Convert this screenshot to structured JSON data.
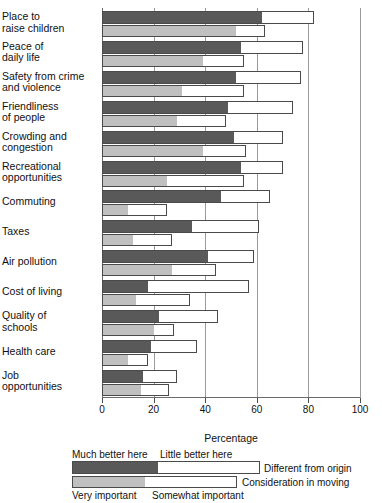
{
  "chart_data": {
    "type": "bar",
    "title": "",
    "subtitle": "",
    "xlabel": "Percentage",
    "ylabel": "",
    "xlim": [
      0,
      100
    ],
    "xticks": [
      0,
      20,
      40,
      60,
      80,
      100
    ],
    "grid": true,
    "orientation": "horizontal",
    "legend_position": "bottom",
    "colors": {
      "much_better_here": "#595959",
      "little_better_here": "#ffffff",
      "very_important": "#c0c0c0",
      "somewhat_important": "#ffffff",
      "bar_outline": "#4a4a4a",
      "gridline": "#9a9a9a"
    },
    "categories": [
      "Place to raise children",
      "Peace of daily life",
      "Safety from crime and violence",
      "Friendliness of people",
      "Crowding and congestion",
      "Recreational opportunities",
      "Commuting",
      "Taxes",
      "Air pollution",
      "Cost of living",
      "Quality of schools",
      "Health care",
      "Job opportunities"
    ],
    "series": [
      {
        "name": "Much better here",
        "group": "Different from origin",
        "values": [
          62,
          54,
          52,
          49,
          51,
          54,
          46,
          35,
          41,
          18,
          22,
          19,
          16
        ]
      },
      {
        "name": "Little better here",
        "group": "Different from origin",
        "values": [
          20,
          24,
          25,
          25,
          19,
          16,
          19,
          26,
          18,
          39,
          23,
          18,
          13
        ]
      },
      {
        "name": "Very important",
        "group": "Consideration in moving",
        "values": [
          52,
          39,
          31,
          29,
          39,
          25,
          10,
          12,
          27,
          13,
          20,
          10,
          15
        ]
      },
      {
        "name": "Somewhat important",
        "group": "Consideration in moving",
        "values": [
          11,
          16,
          24,
          19,
          17,
          30,
          15,
          15,
          17,
          21,
          8,
          8,
          11
        ]
      }
    ],
    "totals": {
      "different_from_origin": [
        82,
        78,
        77,
        74,
        70,
        70,
        65,
        61,
        59,
        57,
        45,
        37,
        29
      ],
      "consideration_in_moving": [
        63,
        55,
        55,
        48,
        56,
        55,
        25,
        27,
        44,
        34,
        28,
        18,
        26
      ]
    },
    "rows": [
      {
        "label": "Place to raise children",
        "label_lines": [
          "Place to",
          "raise children"
        ],
        "much_better": 62,
        "little_better": 20,
        "origin_total": 82,
        "very_important": 52,
        "somewhat_important": 11,
        "moving_total": 63
      },
      {
        "label": "Peace of daily life",
        "label_lines": [
          "Peace of",
          "daily life"
        ],
        "much_better": 54,
        "little_better": 24,
        "origin_total": 78,
        "very_important": 39,
        "somewhat_important": 16,
        "moving_total": 55
      },
      {
        "label": "Safety from crime and violence",
        "label_lines": [
          "Safety from crime",
          "and violence"
        ],
        "much_better": 52,
        "little_better": 25,
        "origin_total": 77,
        "very_important": 31,
        "somewhat_important": 24,
        "moving_total": 55
      },
      {
        "label": "Friendliness of people",
        "label_lines": [
          "Friendliness",
          "of people"
        ],
        "much_better": 49,
        "little_better": 25,
        "origin_total": 74,
        "very_important": 29,
        "somewhat_important": 19,
        "moving_total": 48
      },
      {
        "label": "Crowding and congestion",
        "label_lines": [
          "Crowding and",
          "congestion"
        ],
        "much_better": 51,
        "little_better": 19,
        "origin_total": 70,
        "very_important": 39,
        "somewhat_important": 17,
        "moving_total": 56
      },
      {
        "label": "Recreational opportunities",
        "label_lines": [
          "Recreational",
          "opportunities"
        ],
        "much_better": 54,
        "little_better": 16,
        "origin_total": 70,
        "very_important": 25,
        "somewhat_important": 30,
        "moving_total": 55
      },
      {
        "label": "Commuting",
        "label_lines": [
          "Commuting"
        ],
        "much_better": 46,
        "little_better": 19,
        "origin_total": 65,
        "very_important": 10,
        "somewhat_important": 15,
        "moving_total": 25
      },
      {
        "label": "Taxes",
        "label_lines": [
          "Taxes"
        ],
        "much_better": 35,
        "little_better": 26,
        "origin_total": 61,
        "very_important": 12,
        "somewhat_important": 15,
        "moving_total": 27
      },
      {
        "label": "Air pollution",
        "label_lines": [
          "Air pollution"
        ],
        "much_better": 41,
        "little_better": 18,
        "origin_total": 59,
        "very_important": 27,
        "somewhat_important": 17,
        "moving_total": 44
      },
      {
        "label": "Cost of living",
        "label_lines": [
          "Cost of living"
        ],
        "much_better": 18,
        "little_better": 39,
        "origin_total": 57,
        "very_important": 13,
        "somewhat_important": 21,
        "moving_total": 34
      },
      {
        "label": "Quality of schools",
        "label_lines": [
          "Quality of",
          "schools"
        ],
        "much_better": 22,
        "little_better": 23,
        "origin_total": 45,
        "very_important": 20,
        "somewhat_important": 8,
        "moving_total": 28
      },
      {
        "label": "Health care",
        "label_lines": [
          "Health care"
        ],
        "much_better": 19,
        "little_better": 18,
        "origin_total": 37,
        "very_important": 10,
        "somewhat_important": 8,
        "moving_total": 18
      },
      {
        "label": "Job opportunities",
        "label_lines": [
          "Job",
          "opportunities"
        ],
        "much_better": 16,
        "little_better": 13,
        "origin_total": 29,
        "very_important": 15,
        "somewhat_important": 11,
        "moving_total": 26
      }
    ]
  },
  "axis": {
    "x_title": "Percentage",
    "tick_labels": [
      "0",
      "20",
      "40",
      "60",
      "80",
      "100"
    ]
  },
  "legend": {
    "much_better_here": "Much better here",
    "little_better_here": "Little better here",
    "very_important": "Very important",
    "somewhat_important": "Somewhat important",
    "different_from_origin": "Different from origin",
    "consideration_in_moving": "Consideration in moving"
  }
}
